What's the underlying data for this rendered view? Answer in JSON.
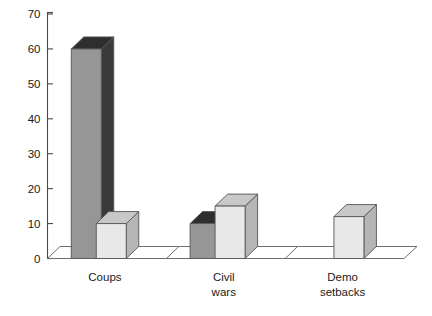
{
  "chart_data": {
    "type": "bar",
    "title": "",
    "subtitle": "",
    "xlabel": "",
    "ylabel": "",
    "ylim": [
      0,
      70
    ],
    "ytick_values": [
      0,
      10,
      20,
      30,
      40,
      50,
      60,
      70
    ],
    "ytick_labels": [
      "0",
      "10",
      "20",
      "30",
      "40",
      "50",
      "60",
      "70"
    ],
    "grid": false,
    "legend": false,
    "legend_position": "none",
    "style": "3d-column",
    "categories": [
      "Coups",
      "Civil wars",
      "Demo setbacks"
    ],
    "category_labels_wrapped": [
      [
        "Coups"
      ],
      [
        "Civil",
        "wars"
      ],
      [
        "Demo",
        "setbacks"
      ]
    ],
    "series": [
      {
        "name": "series-1",
        "color": "#969696",
        "side_color": "#3a3a3a",
        "top_color": "#2e2e2e",
        "values": [
          60,
          10,
          0
        ]
      },
      {
        "name": "series-2",
        "color": "#e8e8e8",
        "side_color": "#b5b5b5",
        "top_color": "#c8c8c8",
        "values": [
          10,
          15,
          12
        ]
      }
    ],
    "annotations": []
  },
  "axis": {
    "y_axis_name": "value-axis",
    "x_axis_name": "category-axis"
  },
  "colors": {
    "background": "#ffffff",
    "axis": "#4a4a4a",
    "text": "#1a1a1a",
    "floor_fill": "#ffffff",
    "floor_edge": "#6f6f6f",
    "dark_bar_front": "#969696",
    "dark_bar_side": "#3a3a3a",
    "dark_bar_top": "#2e2e2e",
    "light_bar_front": "#e8e8e8",
    "light_bar_side": "#b5b5b5",
    "light_bar_top": "#c8c8c8"
  }
}
